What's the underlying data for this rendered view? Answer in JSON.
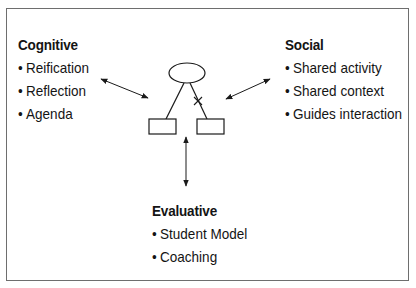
{
  "diagram": {
    "groups": {
      "cognitive": {
        "title": "Cognitive",
        "bullet": "•",
        "items": [
          "Reification",
          "Reflection",
          "Agenda"
        ]
      },
      "social": {
        "title": "Social",
        "bullet": "•",
        "items": [
          "Shared activity",
          "Shared context",
          "Guides interaction"
        ]
      },
      "evaluative": {
        "title": "Evaluative",
        "bullet": "•",
        "items": [
          "Student Model",
          "Coaching"
        ]
      }
    },
    "center_figure": {
      "nodes": [
        "ellipse-top",
        "box-left",
        "box-right"
      ],
      "edges": [
        {
          "from": "ellipse-top",
          "to": "box-left",
          "marked": false
        },
        {
          "from": "ellipse-top",
          "to": "box-right",
          "marked": true
        }
      ]
    },
    "connections": [
      {
        "between": [
          "cognitive",
          "center-figure"
        ],
        "type": "bidirectional-arrow"
      },
      {
        "between": [
          "social",
          "center-figure"
        ],
        "type": "bidirectional-arrow"
      },
      {
        "between": [
          "evaluative",
          "center-figure"
        ],
        "type": "bidirectional-arrow"
      }
    ],
    "colors": {
      "stroke": "#1a1a1a",
      "frame": "#6e6e6e",
      "background": "#ffffff"
    }
  }
}
